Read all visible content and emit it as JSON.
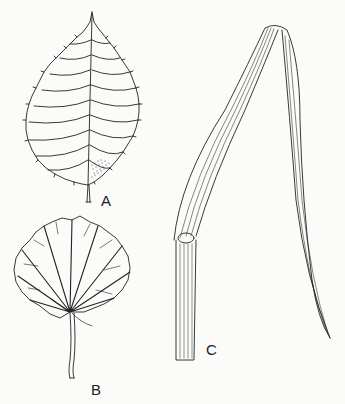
{
  "figure": {
    "labels": {
      "a": "A",
      "b": "B",
      "c": "C"
    },
    "panels": [
      {
        "id": "A",
        "description": "Simple ovate leaf with serrate margin and pinnate venation"
      },
      {
        "id": "B",
        "description": "Rounded palmately-veined leaf with crenate margin and petiole"
      },
      {
        "id": "C",
        "description": "Grass-like leaf with parallel venation and sheathing base"
      }
    ],
    "colors": {
      "ink": "#222222",
      "paper": "#fbfbf9"
    }
  }
}
